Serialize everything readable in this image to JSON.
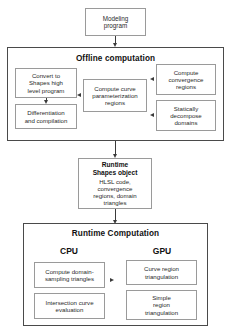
{
  "diagram": {
    "modeling_program": "Modeling\nprogram",
    "offline": {
      "title": "Offline computation",
      "convert": "Convert to\nShapes high\nlevel program",
      "differentiation": "Differentiation\nand compilation",
      "curve_param": "Compute curve\nparameterization\nregions",
      "convergence": "Compute\nconvergence\nregions",
      "static_decompose": "Statically\ndecompose\ndomains"
    },
    "runtime_object": {
      "title": "Runtime\nShapes object",
      "details": "HLSL code,\nconvergence\nregions, domain\ntriangles"
    },
    "runtime": {
      "title": "Runtime Computation",
      "cpu_label": "CPU",
      "gpu_label": "GPU",
      "cpu_sampling": "Compute domain-\nsampling triangles",
      "cpu_intersection": "Intersection curve\nevaluation",
      "gpu_curve": "Curve region\ntriangulation",
      "gpu_simple": "Simple\nregion\ntriangulation"
    },
    "colors": {
      "box_border": "#9a9a9a",
      "outer_border": "#4a4a4a",
      "arrow": "#3a3a3a",
      "text": "#111111",
      "background": "#ffffff"
    }
  }
}
